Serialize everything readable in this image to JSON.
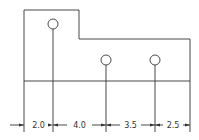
{
  "diagram": {
    "type": "engineering-drawing",
    "stroke_color": "#333333",
    "background": "#ffffff",
    "outline": {
      "points": [
        [
          24,
          10
        ],
        [
          79,
          10
        ],
        [
          79,
          39
        ],
        [
          190,
          39
        ],
        [
          190,
          81
        ],
        [
          24,
          81
        ]
      ]
    },
    "holes": [
      {
        "cx": 53,
        "cy": 24,
        "r": 5
      },
      {
        "cx": 106,
        "cy": 60,
        "r": 5
      },
      {
        "cx": 155,
        "cy": 60,
        "r": 5
      }
    ],
    "extension_lines_x": [
      24,
      53,
      106,
      155,
      190
    ],
    "dimension_line_y": 125,
    "dimensions": [
      {
        "label": "2.0",
        "x1": 24,
        "x2": 53
      },
      {
        "label": "4.0",
        "x1": 53,
        "x2": 106
      },
      {
        "label": "3.5",
        "x1": 106,
        "x2": 155
      },
      {
        "label": "2.5",
        "x1": 155,
        "x2": 190
      }
    ]
  }
}
